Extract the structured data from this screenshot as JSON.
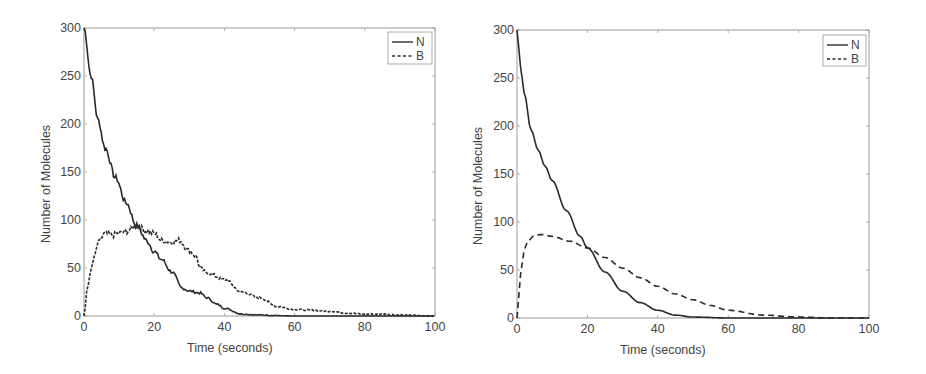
{
  "chart_data": [
    {
      "type": "line",
      "title": "",
      "xlabel": "Time (seconds)",
      "ylabel": "Number of Molecules",
      "xlim": [
        0,
        100
      ],
      "ylim": [
        0,
        300
      ],
      "xticks": [
        0,
        20,
        40,
        60,
        80,
        100
      ],
      "yticks": [
        0,
        50,
        100,
        150,
        200,
        250,
        300
      ],
      "grid": false,
      "legend_position": "upper right",
      "style": "stochastic (noisy)",
      "series": [
        {
          "name": "N",
          "line_style": "solid",
          "x": [
            0,
            2,
            4,
            6,
            9,
            12,
            15,
            18,
            20,
            22,
            25,
            28,
            30,
            33,
            35,
            38,
            40,
            45,
            50,
            60,
            70,
            80,
            90,
            100
          ],
          "values": [
            300,
            250,
            204,
            175,
            144,
            118,
            94,
            78,
            67,
            59,
            46,
            29,
            26,
            24,
            19,
            12,
            8,
            2,
            1,
            0,
            0,
            0,
            0,
            0
          ]
        },
        {
          "name": "B",
          "line_style": "dashed",
          "x": [
            0,
            1,
            2,
            3,
            4,
            6,
            8,
            10,
            12,
            15,
            18,
            20,
            22,
            25,
            27,
            30,
            32,
            33,
            35,
            40,
            45,
            50,
            55,
            60,
            65,
            70,
            75,
            80,
            85,
            90,
            100
          ],
          "values": [
            0,
            30,
            48,
            62,
            76,
            86,
            84,
            86,
            88,
            94,
            88,
            86,
            79,
            77,
            79,
            68,
            62,
            50,
            45,
            38,
            25,
            19,
            10,
            7,
            6,
            5,
            3,
            2,
            2,
            1,
            0
          ]
        }
      ]
    },
    {
      "type": "line",
      "title": "",
      "xlabel": "Time (seconds)",
      "ylabel": "Number of Molecules",
      "xlim": [
        0,
        100
      ],
      "ylim": [
        0,
        300
      ],
      "xticks": [
        0,
        20,
        40,
        60,
        80,
        100
      ],
      "yticks": [
        0,
        50,
        100,
        150,
        200,
        250,
        300
      ],
      "grid": false,
      "legend_position": "upper right",
      "style": "deterministic (smooth)",
      "series": [
        {
          "name": "N",
          "line_style": "solid",
          "x": [
            0,
            1,
            2,
            4,
            6,
            8,
            10,
            14,
            18,
            20,
            25,
            30,
            35,
            40,
            45,
            50,
            60,
            70,
            80,
            100
          ],
          "values": [
            300,
            262,
            235,
            196,
            175,
            158,
            143,
            112,
            85,
            73,
            48,
            28,
            16,
            8,
            3,
            1,
            0,
            0,
            0,
            0
          ]
        },
        {
          "name": "B",
          "line_style": "dashed",
          "x": [
            0,
            1,
            2,
            3,
            5,
            7,
            10,
            15,
            20,
            25,
            30,
            35,
            40,
            45,
            50,
            55,
            60,
            70,
            80,
            90,
            100
          ],
          "values": [
            0,
            45,
            70,
            80,
            86,
            87,
            85,
            80,
            73,
            63,
            52,
            42,
            33,
            25,
            19,
            13,
            8,
            3,
            1,
            0,
            0
          ]
        }
      ]
    }
  ],
  "figures": [
    {
      "xlabel": "Time (seconds)",
      "ylabel": "Number of Molecules",
      "xtick_labels": [
        "0",
        "20",
        "40",
        "60",
        "80",
        "100"
      ],
      "ytick_labels": [
        "0",
        "50",
        "100",
        "150",
        "200",
        "250",
        "300"
      ],
      "legend": [
        {
          "label": "N"
        },
        {
          "label": "B"
        }
      ]
    },
    {
      "xlabel": "Time (seconds)",
      "ylabel": "Number of Molecules",
      "xtick_labels": [
        "0",
        "20",
        "40",
        "60",
        "80",
        "100"
      ],
      "ytick_labels": [
        "0",
        "50",
        "100",
        "150",
        "200",
        "250",
        "300"
      ],
      "legend": [
        {
          "label": "N"
        },
        {
          "label": "B"
        }
      ]
    }
  ],
  "colors": {
    "line": "#2a2a2a",
    "axes": "#9a9a9a",
    "text": "#444444",
    "background": "#ffffff"
  }
}
